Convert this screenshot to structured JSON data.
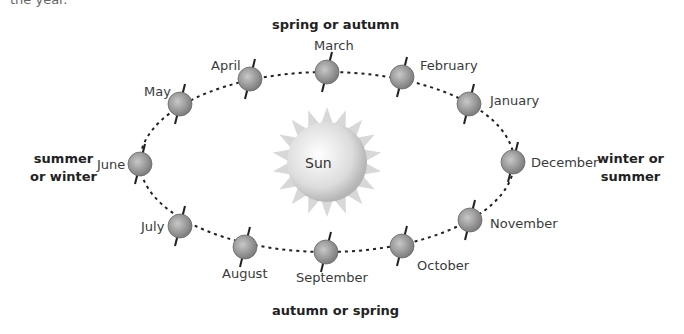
{
  "cropped_text": "the year.",
  "sun": {
    "label": "Sun"
  },
  "seasons": {
    "top": "spring or autumn",
    "bottom": "autumn or spring",
    "left_line1": "summer",
    "left_line2": "or winter",
    "right_line1": "winter or",
    "right_line2": "summer"
  },
  "months": [
    {
      "name": "January",
      "x": 469,
      "y": 104
    },
    {
      "name": "February",
      "x": 402,
      "y": 77
    },
    {
      "name": "March",
      "x": 327,
      "y": 72
    },
    {
      "name": "April",
      "x": 250,
      "y": 79
    },
    {
      "name": "May",
      "x": 180,
      "y": 104
    },
    {
      "name": "June",
      "x": 140,
      "y": 164
    },
    {
      "name": "July",
      "x": 180,
      "y": 226
    },
    {
      "name": "August",
      "x": 245,
      "y": 247
    },
    {
      "name": "September",
      "x": 326,
      "y": 252
    },
    {
      "name": "October",
      "x": 402,
      "y": 246
    },
    {
      "name": "November",
      "x": 470,
      "y": 220
    },
    {
      "name": "December",
      "x": 513,
      "y": 162
    }
  ],
  "colors": {
    "earth": "#9a9a9a",
    "sun": "#e0e0e0",
    "orbit": "#222222"
  }
}
